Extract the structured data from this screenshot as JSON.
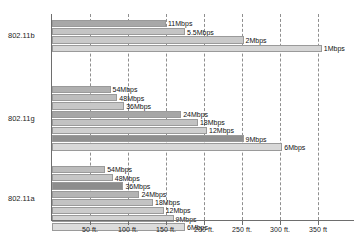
{
  "chart_data": {
    "type": "bar",
    "orientation": "horizontal",
    "title": "",
    "xlabel": "",
    "ylabel": "",
    "xlim": [
      0,
      400
    ],
    "grid": true,
    "legend": "none",
    "xticks": [
      "50 ft.",
      "100 ft.",
      "150 ft.",
      "150 ft.",
      "200 ft.",
      "250 ft.",
      "300 ft.",
      "350 ft"
    ],
    "xtick_values": [
      50,
      100,
      150,
      200,
      250,
      300,
      350
    ],
    "xtick_labels": [
      "50 ft.",
      "100 ft.",
      "150 ft.",
      "200 ft.",
      "250 ft.",
      "300 ft.",
      "350 ft"
    ],
    "groups": [
      {
        "name": "802.11b",
        "bars": [
          {
            "label": "11Mbps",
            "value": 150,
            "color": "#a8a8a8"
          },
          {
            "label": "5.5Mbps",
            "value": 175,
            "color": "#c4c4c4"
          },
          {
            "label": "2Mbps",
            "value": 252,
            "color": "#c9c9c9"
          },
          {
            "label": "1Mbps",
            "value": 355,
            "color": "#d6d6d6"
          }
        ]
      },
      {
        "name": "802.11g",
        "bars": [
          {
            "label": "54Mbps",
            "value": 77,
            "color": "#b0b0b0"
          },
          {
            "label": "48Mbps",
            "value": 86,
            "color": "#bdbdbd"
          },
          {
            "label": "36Mbps",
            "value": 95,
            "color": "#c7c7c7"
          },
          {
            "label": "24Mbps",
            "value": 170,
            "color": "#a6a6a6"
          },
          {
            "label": "18Mbps",
            "value": 192,
            "color": "#c2c2c2"
          },
          {
            "label": "12Mbps",
            "value": 204,
            "color": "#cfcfcf"
          },
          {
            "label": "9Mbps",
            "value": 252,
            "color": "#8f8f8f"
          },
          {
            "label": "6Mbps",
            "value": 303,
            "color": "#d8d8d8"
          }
        ]
      },
      {
        "name": "802.11a",
        "bars": [
          {
            "label": "54Mbps",
            "value": 70,
            "color": "#bcbcbc"
          },
          {
            "label": "48Mbps",
            "value": 80,
            "color": "#c6c6c6"
          },
          {
            "label": "36Mbps",
            "value": 94,
            "color": "#8d8d8d"
          },
          {
            "label": "24Mbps",
            "value": 115,
            "color": "#b4b4b4"
          },
          {
            "label": "18Mbps",
            "value": 133,
            "color": "#c3c3c3"
          },
          {
            "label": "12Mbps",
            "value": 147,
            "color": "#cbcbcb"
          },
          {
            "label": "9Mbps",
            "value": 160,
            "color": "#d2d2d2"
          },
          {
            "label": "6Mbps",
            "value": 175,
            "color": "#dcdcdc"
          }
        ]
      }
    ]
  },
  "axis": {
    "y_categories": [
      "802.11b",
      "802.11g",
      "802.11a"
    ]
  }
}
